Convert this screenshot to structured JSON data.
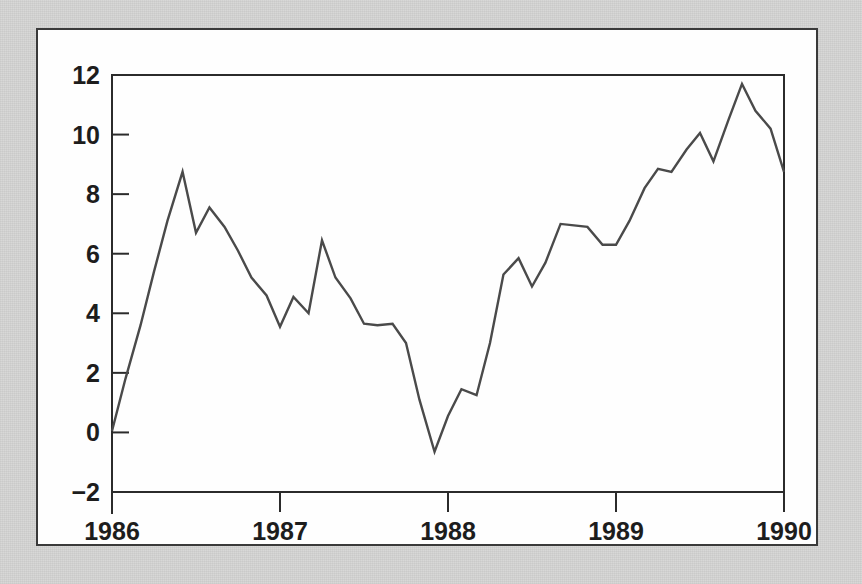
{
  "figure": {
    "background_color": "#d8d8d7",
    "panel_color": "#fefefe",
    "border_color": "#3a3a3a",
    "line_color": "#4a4a4a"
  },
  "chart_data": {
    "type": "line",
    "title": "",
    "xlabel": "",
    "ylabel": "",
    "xlim": [
      1986.0,
      1990.0
    ],
    "ylim": [
      -2,
      12
    ],
    "grid": false,
    "legend": null,
    "xticks": [
      1986,
      1987,
      1988,
      1989,
      1990
    ],
    "xtick_labels": [
      "1986",
      "1987",
      "1988",
      "1989",
      "1990"
    ],
    "yticks": [
      -2,
      0,
      2,
      4,
      6,
      8,
      10,
      12
    ],
    "ytick_labels": [
      "−2",
      "0",
      "2",
      "4",
      "6",
      "8",
      "10",
      "12"
    ],
    "series": [
      {
        "name": "series-1",
        "x": [
          1986.0,
          1986.08,
          1986.17,
          1986.25,
          1986.33,
          1986.42,
          1986.5,
          1986.58,
          1986.67,
          1986.75,
          1986.83,
          1986.92,
          1987.0,
          1987.08,
          1987.17,
          1987.25,
          1987.33,
          1987.42,
          1987.5,
          1987.58,
          1987.67,
          1987.75,
          1987.83,
          1987.92,
          1988.0,
          1988.08,
          1988.17,
          1988.25,
          1988.33,
          1988.42,
          1988.5,
          1988.58,
          1988.67,
          1988.75,
          1988.83,
          1988.92,
          1989.0,
          1989.08,
          1989.17,
          1989.25,
          1989.33,
          1989.42,
          1989.5,
          1989.58,
          1989.67,
          1989.75,
          1989.83,
          1989.92,
          1990.0
        ],
        "y": [
          0.05,
          1.8,
          3.6,
          5.4,
          7.1,
          8.75,
          6.7,
          7.55,
          6.9,
          6.1,
          5.2,
          4.6,
          3.55,
          4.55,
          4.0,
          6.45,
          5.2,
          4.5,
          3.65,
          3.6,
          3.65,
          3.0,
          1.1,
          -0.65,
          0.55,
          1.45,
          1.25,
          3.0,
          5.3,
          5.85,
          4.9,
          5.7,
          7.0,
          6.95,
          6.9,
          6.3,
          6.3,
          7.1,
          8.2,
          8.85,
          8.75,
          9.5,
          10.05,
          9.1,
          10.5,
          11.7,
          10.8,
          10.2,
          8.75
        ]
      }
    ]
  }
}
